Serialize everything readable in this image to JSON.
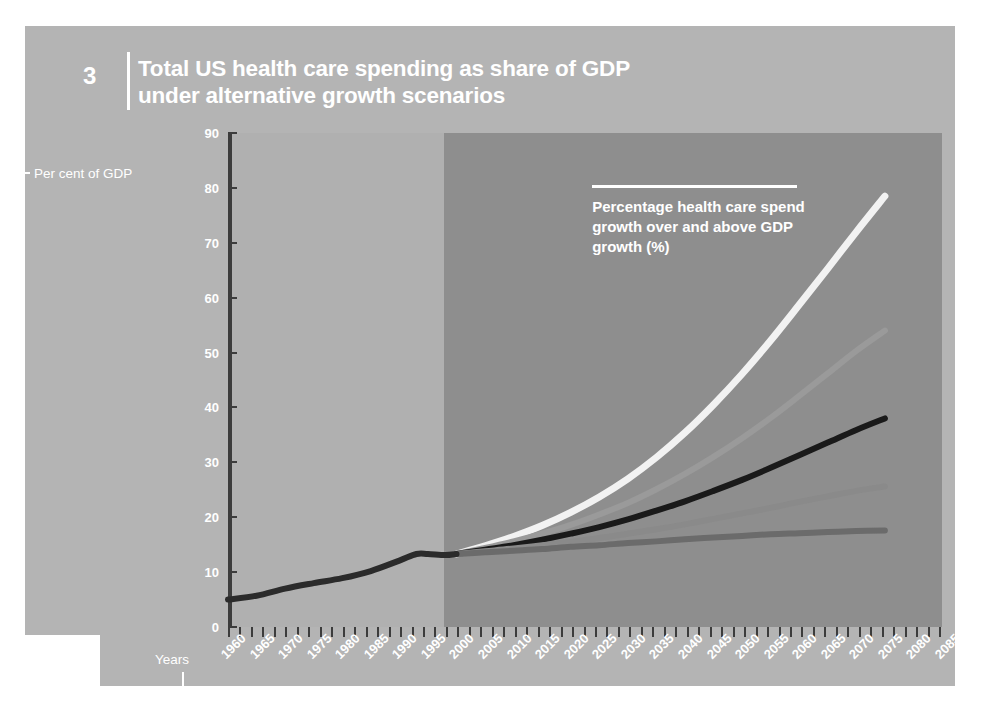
{
  "figure": {
    "number": "3",
    "title": "Total US health care spending as share of GDP under alternative growth scenarios",
    "y_caption": "Per cent of GDP",
    "x_caption": "Years"
  },
  "legend": {
    "text": "Percentage health care spend growth over and above GDP growth (%)"
  },
  "colors": {
    "card": "#b4b4b4",
    "panel_historical": "#b0b0b0",
    "panel_projection": "#8e8e8e",
    "axis": "#3c3c3c",
    "text": "#ffffff",
    "series_2": "#f2f2f2",
    "series_1_5": "#9a9a9a",
    "series_1": "#1a1a1a",
    "series_0_5": "#8a8a8a",
    "series_0": "#6b6b6b",
    "historical": "#2b2b2b"
  },
  "chart_data": {
    "type": "line",
    "title": "Total US health care spending as share of GDP under alternative growth scenarios",
    "xlabel": "Years",
    "ylabel": "Per cent of GDP",
    "xlim": [
      1960,
      2085
    ],
    "ylim": [
      0,
      90
    ],
    "ytick_step": 10,
    "yticks": [
      0,
      10,
      20,
      30,
      40,
      50,
      60,
      70,
      80,
      90
    ],
    "xticks": [
      1960,
      1965,
      1970,
      1975,
      1980,
      1985,
      1990,
      1995,
      2000,
      2005,
      2010,
      2015,
      2020,
      2025,
      2030,
      2035,
      2040,
      2045,
      2050,
      2055,
      2060,
      2065,
      2070,
      2075,
      2080,
      2085
    ],
    "grid": false,
    "legend_position": "inside-top-right",
    "projection_start_year": 2000,
    "annotations": [
      "Shaded band left of 2000 is historical data; right of 2000 is projection."
    ],
    "historical": {
      "name": "Historical",
      "x": [
        1960,
        1965,
        1970,
        1975,
        1980,
        1985,
        1990,
        1993,
        1995,
        1998,
        2000
      ],
      "values": [
        5.0,
        5.7,
        7.0,
        8.0,
        8.9,
        10.2,
        12.1,
        13.3,
        13.3,
        13.1,
        13.3
      ]
    },
    "x": [
      2000,
      2005,
      2010,
      2015,
      2020,
      2025,
      2030,
      2035,
      2040,
      2045,
      2050,
      2055,
      2060,
      2065,
      2070,
      2075
    ],
    "series": [
      {
        "name": "2",
        "label": "2",
        "values": [
          13.3,
          14.8,
          16.5,
          18.5,
          20.9,
          23.7,
          27.0,
          30.9,
          35.4,
          40.5,
          46.1,
          52.2,
          58.7,
          65.3,
          72.0,
          78.5
        ]
      },
      {
        "name": "1.5",
        "label": "1.5",
        "values": [
          13.3,
          14.4,
          15.6,
          17.0,
          18.6,
          20.5,
          22.6,
          25.1,
          27.9,
          31.0,
          34.4,
          38.1,
          42.1,
          46.2,
          50.3,
          54.0
        ]
      },
      {
        "name": "1",
        "label": "1",
        "values": [
          13.3,
          14.1,
          14.9,
          15.9,
          17.0,
          18.2,
          19.6,
          21.2,
          22.9,
          24.8,
          26.8,
          29.0,
          31.3,
          33.6,
          35.9,
          38.0
        ]
      },
      {
        "name": "0.5",
        "label": "0.5",
        "values": [
          13.3,
          13.8,
          14.3,
          14.9,
          15.5,
          16.2,
          17.0,
          17.8,
          18.7,
          19.7,
          20.7,
          21.7,
          22.8,
          23.8,
          24.8,
          25.6
        ]
      },
      {
        "name": "0",
        "label": "0",
        "values": [
          13.3,
          13.6,
          13.9,
          14.2,
          14.6,
          14.9,
          15.3,
          15.6,
          16.0,
          16.3,
          16.6,
          16.9,
          17.1,
          17.3,
          17.5,
          17.6
        ]
      }
    ]
  }
}
